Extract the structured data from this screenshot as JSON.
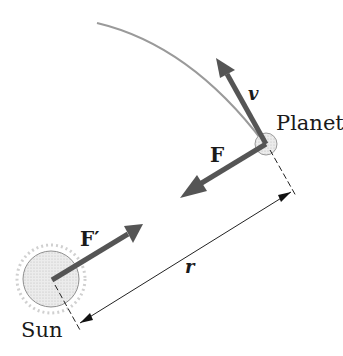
{
  "diagram": {
    "title": "",
    "labels": {
      "planet": "Planet",
      "sun": "Sun",
      "velocity": "v",
      "force_on_planet": "F",
      "force_on_sun": "F′",
      "distance": "r"
    },
    "colors": {
      "orbit": "#9a9a9a",
      "arrow": "#555555",
      "text": "#1a1a1a",
      "sun_fill": "#e6e6e6",
      "planet_fill": "#d8d8d8",
      "dimension_line": "#222222"
    }
  }
}
